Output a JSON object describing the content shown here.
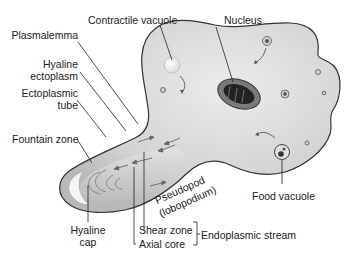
{
  "figure": {
    "colors": {
      "cell": "#d9d9d9",
      "outline": "#333333",
      "text": "#222222",
      "nucleus": "#3a3a3a"
    },
    "labels": {
      "contractile_vacuole": "Contractile vacuole",
      "nucleus": "Nucleus",
      "plasmalemma": "Plasmalemma",
      "hyaline_ectoplasm_1": "Hyaline",
      "hyaline_ectoplasm_2": "ectoplasm",
      "ectoplasmic_tube_1": "Ectoplasmic",
      "ectoplasmic_tube_2": "tube",
      "fountain_zone": "Fountain zone",
      "pseudopod_1": "Pseudopod",
      "pseudopod_2": "(lobopodium)",
      "food_vacuole": "Food vacuole",
      "hyaline_cap_1": "Hyaline",
      "hyaline_cap_2": "cap",
      "shear_zone": "Shear zone",
      "axial_core": "Axial core",
      "endoplasmic_stream": "Endoplasmic stream"
    }
  }
}
